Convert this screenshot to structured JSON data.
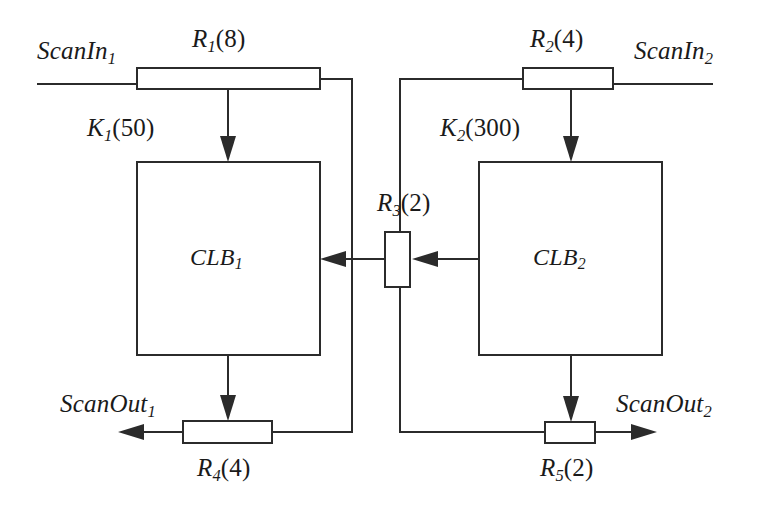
{
  "diagram": {
    "stroke_color": "#2b2b2b",
    "text_color": "#1a1a1a",
    "background": "#ffffff",
    "blocks": [
      {
        "id": "clb1",
        "name": "CLB",
        "index": "1",
        "label": "CLB1"
      },
      {
        "id": "clb2",
        "name": "CLB",
        "index": "2",
        "label": "CLB2"
      }
    ],
    "registers": [
      {
        "id": "r1",
        "name": "R",
        "index": "1",
        "value": "8",
        "label": "R1(8)"
      },
      {
        "id": "r2",
        "name": "R",
        "index": "2",
        "value": "4",
        "label": "R2(4)"
      },
      {
        "id": "r3",
        "name": "R",
        "index": "3",
        "value": "2",
        "label": "R3(2)"
      },
      {
        "id": "r4",
        "name": "R",
        "index": "4",
        "value": "4",
        "label": "R4(4)"
      },
      {
        "id": "r5",
        "name": "R",
        "index": "5",
        "value": "2",
        "label": "R5(2)"
      }
    ],
    "constants": [
      {
        "id": "k1",
        "name": "K",
        "index": "1",
        "value": "50",
        "label": "K1(50)"
      },
      {
        "id": "k2",
        "name": "K",
        "index": "2",
        "value": "300",
        "label": "K2(300)"
      }
    ],
    "ports": [
      {
        "id": "scanin1",
        "name": "ScanIn",
        "index": "1",
        "label": "ScanIn1",
        "direction": "input"
      },
      {
        "id": "scanin2",
        "name": "ScanIn",
        "index": "2",
        "label": "ScanIn2",
        "direction": "input"
      },
      {
        "id": "scanout1",
        "name": "ScanOut",
        "index": "1",
        "label": "ScanOut1",
        "direction": "output"
      },
      {
        "id": "scanout2",
        "name": "ScanOut",
        "index": "2",
        "label": "ScanOut2",
        "direction": "output"
      }
    ]
  }
}
